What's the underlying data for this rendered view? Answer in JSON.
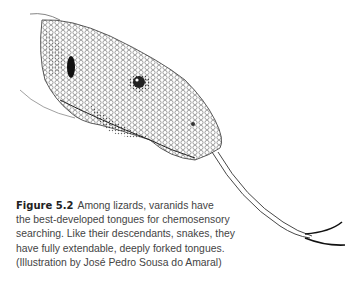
{
  "figure": {
    "label": "Figure 5.2",
    "caption_lines": [
      "Among lizards, varanids have",
      "the best-developed tongues for chemosensory",
      "searching. Like their descendants, snakes, they",
      "have fully extendable, deeply forked tongues.",
      "(Illustration by José Pedro Sousa do Amaral)"
    ],
    "illustration": "monitor-lizard-head-with-forked-tongue"
  }
}
